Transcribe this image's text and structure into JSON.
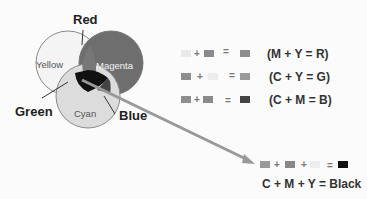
{
  "venn": {
    "circles": [
      {
        "name": "yellow",
        "label": "Yellow",
        "fill": "#f4f4f4"
      },
      {
        "name": "magenta",
        "label": "Magenta",
        "fill": "#6e6e6e"
      },
      {
        "name": "cyan",
        "label": "Cyan",
        "fill": "#dcdcdc"
      }
    ],
    "labels": {
      "red": "Red",
      "green": "Green",
      "blue": "Blue"
    }
  },
  "equations": [
    {
      "text": "(M + Y = R)",
      "swatches": [
        "#e9e9e9",
        "#8a8a8a",
        "#8d8d8d"
      ]
    },
    {
      "text": "(C + Y = G)",
      "swatches": [
        "#8e8e8e",
        "#ececec",
        "#9a9a9a"
      ]
    },
    {
      "text": "(C + M = B)",
      "swatches": [
        "#8e8e8e",
        "#8a8a8a",
        "#444444"
      ]
    }
  ],
  "black_equation": {
    "text": "C + M + Y = Black",
    "swatches": [
      "#999999",
      "#888888",
      "#eeeeee",
      "#111111"
    ]
  },
  "symbols": {
    "plus": "+",
    "equals": "="
  }
}
